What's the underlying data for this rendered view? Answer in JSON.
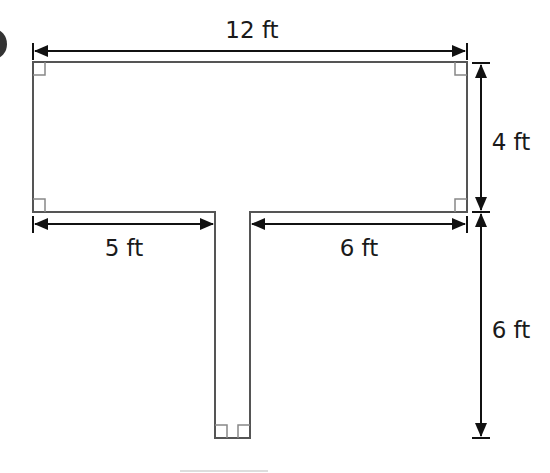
{
  "figure": {
    "type": "composite-rectangle-T-shape",
    "units": "ft",
    "shapes": {
      "top_rectangle": {
        "width": "12 ft",
        "height": "4 ft"
      },
      "stem": {
        "height": "6 ft"
      }
    },
    "dimensions": {
      "top_width": "12 ft",
      "right_height_upper": "4 ft",
      "right_height_lower": "6 ft",
      "bottom_left_segment": "5 ft",
      "bottom_right_segment": "6 ft"
    },
    "right_angle_markers": 6,
    "colors": {
      "outline": "#555555",
      "dimension_lines": "#111111",
      "right_angle_marker": "#777777",
      "background": "#ffffff"
    }
  }
}
